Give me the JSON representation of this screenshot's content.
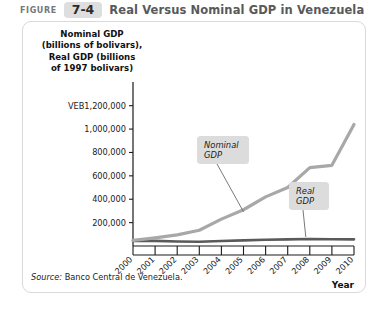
{
  "header": {
    "figure_word": "FIGURE",
    "figure_number": "7-4",
    "title": "Real Versus Nominal GDP in Venezuela"
  },
  "axis_title": {
    "line1": "Nominal GDP",
    "line2": "(billions of bolivars),",
    "line3": "Real GDP (billions",
    "line4": "of 1997 bolivars)"
  },
  "source": {
    "label": "Source:",
    "text": " Banco Central de Venezuela."
  },
  "colors": {
    "nominal_line": "#a8a8a8",
    "real_line": "#5a5a5a",
    "axis": "#1a1a1a",
    "callout_bg": "#dcdcdc",
    "card_border": "#d9d9d9",
    "badge_bg": "#dedede",
    "title_text": "#58595b"
  },
  "chart_data": {
    "type": "line",
    "title": "Real Versus Nominal GDP in Venezuela",
    "xlabel": "Year",
    "ylabel": "Nominal GDP (billions of bolivars), Real GDP (billions of 1997 bolivars)",
    "x": [
      2000,
      2001,
      2002,
      2003,
      2004,
      2005,
      2006,
      2007,
      2008,
      2009,
      2010
    ],
    "categories": [
      "2000",
      "2001",
      "2002",
      "2003",
      "2004",
      "2005",
      "2006",
      "2007",
      "2008",
      "2009",
      "2010"
    ],
    "ytick_labels": [
      "VEB1,200,000",
      "1,000,000",
      "800,000",
      "600,000",
      "400,000",
      "200,000"
    ],
    "ytick_values": [
      1200000,
      1000000,
      800000,
      600000,
      400000,
      200000
    ],
    "ylim": [
      0,
      1300000
    ],
    "xlim": [
      2000,
      2010
    ],
    "grid": false,
    "legend": "annotations",
    "series": [
      {
        "name": "Nominal GDP",
        "color": "#a8a8a8",
        "values": [
          48000,
          70000,
          95000,
          135000,
          230000,
          310000,
          420000,
          500000,
          670000,
          690000,
          1040000
        ]
      },
      {
        "name": "Real GDP",
        "color": "#5a5a5a",
        "values": [
          43000,
          43500,
          39000,
          36500,
          43000,
          48000,
          53000,
          57000,
          60000,
          58000,
          57000
        ]
      }
    ],
    "annotations": [
      {
        "label_line1": "Nominal",
        "label_line2": "GDP",
        "points_to_year": 2005
      },
      {
        "label_line1": "Real",
        "label_line2": "GDP",
        "points_to_year": 2008
      }
    ]
  }
}
